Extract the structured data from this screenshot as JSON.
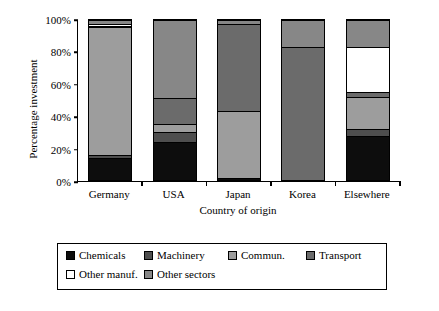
{
  "chart_data": {
    "type": "bar",
    "subtype": "stacked-100-percent",
    "title": "",
    "xlabel": "Country of origin",
    "ylabel": "Percentage investment",
    "categories": [
      "Germany",
      "USA",
      "Japan",
      "Korea",
      "Elsewhere"
    ],
    "ylim": [
      0,
      100
    ],
    "yticks": [
      "0%",
      "20%",
      "40%",
      "60%",
      "80%",
      "100%"
    ],
    "ytick_values": [
      0,
      20,
      40,
      60,
      80,
      100
    ],
    "grid": false,
    "legend_position": "bottom",
    "series": [
      {
        "name": "Chemicals",
        "color": "#0d0d0d",
        "values": [
          14,
          24,
          2,
          0,
          28
        ]
      },
      {
        "name": "Machinery",
        "color": "#4e4e4e",
        "values": [
          2,
          6,
          0,
          0,
          4
        ]
      },
      {
        "name": "Commun.",
        "color": "#9d9d9d",
        "values": [
          79,
          5,
          41,
          0,
          20
        ]
      },
      {
        "name": "Transport",
        "color": "#6b6b6b",
        "values": [
          1,
          16,
          54,
          83,
          3
        ]
      },
      {
        "name": "Other manuf.",
        "color": "#ffffff",
        "values": [
          1,
          0,
          0,
          0,
          28
        ]
      },
      {
        "name": "Other sectors",
        "color": "#878787",
        "values": [
          3,
          49,
          3,
          17,
          17
        ]
      }
    ]
  },
  "axis": {
    "y_title": "Percentage investment",
    "x_title": "Country of origin"
  },
  "legend": {
    "rows": [
      [
        {
          "label": "Chemicals",
          "color": "#0d0d0d"
        },
        {
          "label": "Machinery",
          "color": "#4e4e4e"
        },
        {
          "label": "Commun.",
          "color": "#9d9d9d"
        },
        {
          "label": "Transport",
          "color": "#6b6b6b"
        }
      ],
      [
        {
          "label": "Other manuf.",
          "color": "#ffffff"
        },
        {
          "label": "Other sectors",
          "color": "#878787"
        }
      ]
    ]
  }
}
